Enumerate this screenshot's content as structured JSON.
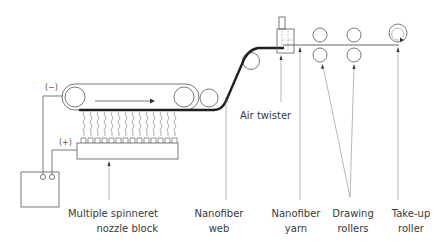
{
  "diagram": {
    "polarity": {
      "negative": "(−)",
      "positive": "(+)"
    },
    "labels": {
      "air_twister": "Air twister",
      "spinneret_line1": "Multiple spinneret",
      "spinneret_line2": "nozzle block",
      "web_line1": "Nanofiber",
      "web_line2": "web",
      "yarn_line1": "Nanofiber",
      "yarn_line2": "yarn",
      "drawing_line1": "Drawing",
      "drawing_line2": "rollers",
      "takeup_line1": "Take-up",
      "takeup_line2": "roller"
    },
    "components": [
      {
        "name": "high-voltage power supply"
      },
      {
        "name": "collector belt conveyor",
        "rollers": 2
      },
      {
        "name": "guide roller"
      },
      {
        "name": "multiple spinneret nozzle block",
        "nozzles": 15
      },
      {
        "name": "upper guide roller"
      },
      {
        "name": "air twister"
      },
      {
        "name": "drawing rollers",
        "pairs": 2
      },
      {
        "name": "take-up roller"
      }
    ],
    "colors": {
      "line": "#6b6b6b",
      "web": "#1f1f1f",
      "text": "#3a3a3a"
    }
  }
}
